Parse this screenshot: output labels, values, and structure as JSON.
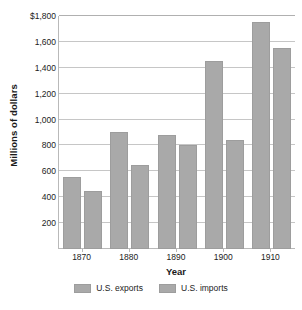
{
  "chart_data": {
    "type": "bar",
    "title": "",
    "xlabel": "Year",
    "ylabel": "Millions of dollars",
    "categories": [
      "1870",
      "1880",
      "1890",
      "1900",
      "1910"
    ],
    "series": [
      {
        "name": "U.S. exports",
        "values": [
          555,
          905,
          880,
          1450,
          1750
        ],
        "color": "#a9a9a9"
      },
      {
        "name": "U.S. imports",
        "values": [
          445,
          650,
          800,
          845,
          1550
        ],
        "color": "#a9a9a9"
      }
    ],
    "ylim": [
      0,
      1800
    ],
    "yticks": [
      200,
      400,
      600,
      800,
      1000,
      1200,
      1400,
      1600,
      1800
    ],
    "ytick_labels": [
      "200",
      "400",
      "600",
      "800",
      "1,000",
      "1,200",
      "1,400",
      "1,600",
      "$1,800"
    ],
    "grid": true,
    "legend_position": "bottom"
  },
  "legend": {
    "items": [
      {
        "label": "U.S. exports"
      },
      {
        "label": "U.S. imports"
      }
    ]
  },
  "axes": {
    "x_title": "Year",
    "y_title": "Millions of dollars"
  }
}
